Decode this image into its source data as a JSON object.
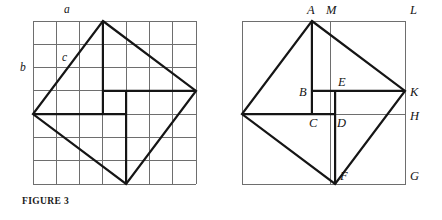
{
  "figure_left": {
    "caption": "FIGURE 3",
    "grid": {
      "cols": 7,
      "rows": 7
    },
    "labels": [
      {
        "id": "a",
        "text": "a"
      },
      {
        "id": "b",
        "text": "b"
      },
      {
        "id": "c",
        "text": "c"
      }
    ]
  },
  "figure_right": {
    "caption": "FIGURE 3′",
    "labels": [
      {
        "id": "A",
        "text": "A"
      },
      {
        "id": "M",
        "text": "M"
      },
      {
        "id": "L",
        "text": "L"
      },
      {
        "id": "B",
        "text": "B"
      },
      {
        "id": "E",
        "text": "E"
      },
      {
        "id": "K",
        "text": "K"
      },
      {
        "id": "C",
        "text": "C"
      },
      {
        "id": "D",
        "text": "D"
      },
      {
        "id": "H",
        "text": "H"
      },
      {
        "id": "F",
        "text": "F"
      },
      {
        "id": "G",
        "text": "G"
      }
    ]
  },
  "colors": {
    "ink": "#1a1a1a",
    "grid_line": "#6e6e6e",
    "thick_line": "#151515",
    "background": "#ffffff"
  }
}
